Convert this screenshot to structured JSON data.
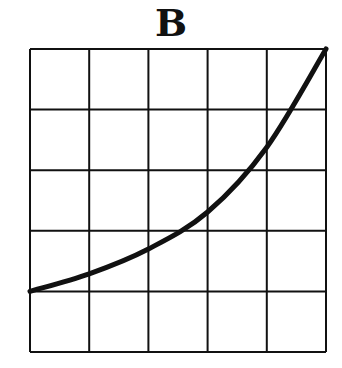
{
  "title": "B",
  "chart_data": {
    "type": "line",
    "title": "B",
    "xlabel": "",
    "ylabel": "",
    "grid": true,
    "grid_cells": [
      5,
      5
    ],
    "xlim": [
      0,
      5
    ],
    "ylim": [
      0,
      5
    ],
    "x_ticks": [],
    "y_ticks": [],
    "series": [
      {
        "name": "curve",
        "x": [
          0,
          1,
          2,
          3,
          4,
          5
        ],
        "y": [
          1.0,
          1.29,
          1.7,
          2.31,
          3.38,
          5.0
        ]
      }
    ],
    "shape": "convex increasing (exponential-like)",
    "line_color": "#111111"
  }
}
